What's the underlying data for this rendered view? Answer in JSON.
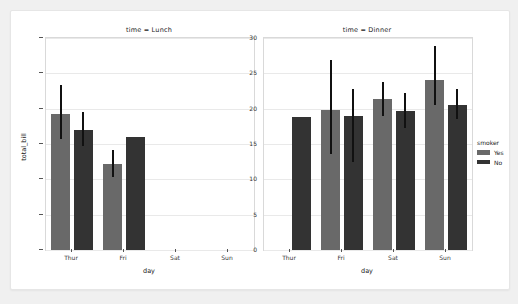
{
  "chart_data": {
    "type": "bar",
    "title": "",
    "xlabel": "day",
    "ylabel": "total_bill",
    "ylim": [
      0,
      30
    ],
    "yticks": [
      0,
      5,
      10,
      15,
      20,
      25,
      30
    ],
    "categories": [
      "Thur",
      "Fri",
      "Sat",
      "Sun"
    ],
    "grid": true,
    "legend": {
      "title": "smoker",
      "position": "right-outside",
      "entries": [
        {
          "label": "Yes",
          "color": "#696969"
        },
        {
          "label": "No",
          "color": "#333333"
        }
      ]
    },
    "facets": [
      {
        "title": "time = Lunch",
        "facet_var": "time",
        "facet_value": "Lunch",
        "series": [
          {
            "name": "Yes",
            "color": "#696969",
            "values": [
              19.2,
              12.2,
              null,
              null
            ],
            "ci_low": [
              15.7,
              10.3,
              null,
              null
            ],
            "ci_high": [
              23.4,
              14.2,
              null,
              null
            ]
          },
          {
            "name": "No",
            "color": "#333333",
            "values": [
              17.0,
              16.0,
              null,
              null
            ],
            "ci_low": [
              14.7,
              null,
              null,
              null
            ],
            "ci_high": [
              19.5,
              null,
              null,
              null
            ]
          }
        ]
      },
      {
        "title": "time = Dinner",
        "facet_var": "time",
        "facet_value": "Dinner",
        "series": [
          {
            "name": "Yes",
            "color": "#696969",
            "values": [
              null,
              19.8,
              21.3,
              24.1
            ],
            "ci_low": [
              null,
              13.6,
              19.0,
              20.5
            ],
            "ci_high": [
              null,
              26.9,
              23.8,
              28.8
            ]
          },
          {
            "name": "No",
            "color": "#333333",
            "values": [
              null,
              19.0,
              19.7,
              20.5
            ],
            "ci_low": [
              null,
              12.5,
              17.2,
              18.5
            ],
            "ci_high": [
              null,
              22.8,
              22.2,
              22.8
            ]
          }
        ]
      }
    ],
    "dinner_thur_single": {
      "note": "Thur Dinner has only the No series bar",
      "value": 18.8
    }
  }
}
